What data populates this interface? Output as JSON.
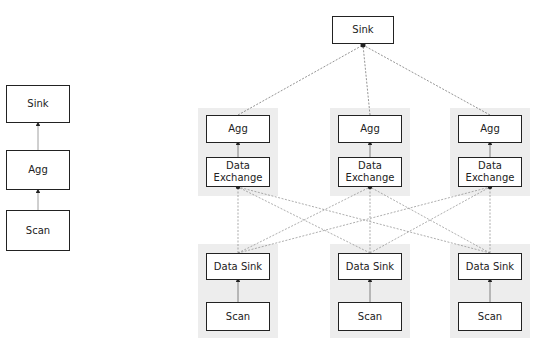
{
  "left_plan": {
    "nodes": [
      {
        "id": "sink",
        "label": "Sink",
        "x": 6,
        "y": 85,
        "w": 64,
        "h": 38
      },
      {
        "id": "agg",
        "label": "Agg",
        "x": 6,
        "y": 150,
        "w": 64,
        "h": 40
      },
      {
        "id": "scan",
        "label": "Scan",
        "x": 6,
        "y": 210,
        "w": 64,
        "h": 41
      }
    ]
  },
  "right_plan": {
    "top_sink": {
      "label": "Sink",
      "x": 332,
      "y": 16,
      "w": 62,
      "h": 28
    },
    "columns": [
      {
        "agg": "Agg",
        "exchange_line1": "Data",
        "exchange_line2": "Exchange",
        "data_sink": "Data Sink",
        "scan": "Scan",
        "x": 206
      },
      {
        "agg": "Agg",
        "exchange_line1": "Data",
        "exchange_line2": "Exchange",
        "data_sink": "Data Sink",
        "scan": "Scan",
        "x": 338
      },
      {
        "agg": "Agg",
        "exchange_line1": "Data",
        "exchange_line2": "Exchange",
        "data_sink": "Data Sink",
        "scan": "Scan",
        "x": 458
      }
    ]
  },
  "colors": {
    "border": "#222222",
    "group_bg": "#ededed",
    "edge": "#555555"
  }
}
